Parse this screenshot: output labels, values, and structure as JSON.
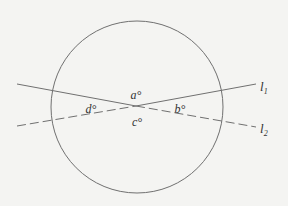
{
  "diagram": {
    "type": "geometry",
    "background": "#f4f4f2",
    "stroke_color": "#707070",
    "circle": {
      "cx": 137,
      "cy": 107,
      "r": 86
    },
    "intersection": {
      "x": 136,
      "y": 106
    },
    "lines": [
      {
        "id": "l1",
        "label": "l",
        "subscript": "1",
        "from": {
          "x": 17,
          "y": 126
        },
        "to": {
          "x": 256,
          "y": 84
        },
        "style_left_of_intersection": "dashed",
        "style_right_of_intersection": "solid"
      },
      {
        "id": "l2",
        "label": "l",
        "subscript": "2",
        "from": {
          "x": 17,
          "y": 84
        },
        "to": {
          "x": 256,
          "y": 127
        },
        "style_left_of_intersection": "solid",
        "style_right_of_intersection": "dashed"
      }
    ],
    "angles": [
      {
        "label": "a°",
        "x": 136,
        "y": 96
      },
      {
        "label": "b°",
        "x": 176,
        "y": 113
      },
      {
        "label": "c°",
        "x": 135,
        "y": 124
      },
      {
        "label": "d°",
        "x": 87,
        "y": 113
      }
    ]
  }
}
